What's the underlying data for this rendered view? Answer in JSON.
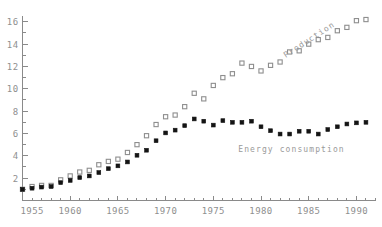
{
  "chart_data": {
    "type": "scatter",
    "title": "",
    "xlabel": "",
    "ylabel": "",
    "xlim": [
      1955,
      1992
    ],
    "ylim": [
      0,
      17
    ],
    "grid": false,
    "legend_position": "inline-annotation",
    "x_ticks": [
      1955,
      1960,
      1965,
      1970,
      1975,
      1980,
      1985,
      1990
    ],
    "x_tick_labels": [
      "1955",
      "1960",
      "1965",
      "1970",
      "1975",
      "1980",
      "1985",
      "1990"
    ],
    "x_minor_tick_step": 1,
    "y_ticks": [
      2,
      4,
      6,
      8,
      10,
      12,
      14,
      16
    ],
    "y_tick_labels": [
      "2",
      "4",
      "6",
      "8",
      "10",
      "12",
      "14",
      "16"
    ],
    "y_minor_tick_step": 1,
    "x": [
      1955,
      1956,
      1957,
      1958,
      1959,
      1960,
      1961,
      1962,
      1963,
      1964,
      1965,
      1966,
      1967,
      1968,
      1969,
      1970,
      1971,
      1972,
      1973,
      1974,
      1975,
      1976,
      1977,
      1978,
      1979,
      1980,
      1981,
      1982,
      1983,
      1984,
      1985,
      1986,
      1987,
      1988,
      1989,
      1990,
      1991
    ],
    "series": [
      {
        "name": "Production",
        "marker": "open-square",
        "color": "#8e8e8e",
        "values": [
          1.0,
          1.25,
          1.35,
          1.35,
          1.85,
          2.2,
          2.55,
          2.7,
          3.2,
          3.5,
          3.7,
          4.3,
          5.0,
          5.8,
          6.8,
          7.5,
          7.65,
          8.4,
          9.6,
          9.1,
          10.3,
          11.0,
          11.35,
          12.3,
          12.0,
          11.6,
          12.1,
          12.4,
          13.3,
          13.4,
          14.0,
          14.4,
          14.6,
          15.2,
          15.5,
          16.1,
          16.2
        ]
      },
      {
        "name": "Energy consumption",
        "marker": "filled-square",
        "color": "#141414",
        "values": [
          1.0,
          1.1,
          1.2,
          1.25,
          1.6,
          1.8,
          2.05,
          2.2,
          2.5,
          2.85,
          3.1,
          3.45,
          4.05,
          4.5,
          5.35,
          6.05,
          6.3,
          6.7,
          7.3,
          7.1,
          6.75,
          7.15,
          7.0,
          7.0,
          7.1,
          6.6,
          6.25,
          5.95,
          5.95,
          6.2,
          6.2,
          5.95,
          6.35,
          6.6,
          6.85,
          6.95,
          7.0
        ]
      }
    ],
    "annotations": [
      {
        "text": "Production",
        "x": 1985.2,
        "y": 14.2,
        "rotation": -33,
        "color": "#9a9a9a"
      },
      {
        "text": "Energy consumption",
        "x": 1983.2,
        "y": 4.35,
        "rotation": 0,
        "color": "#9a9a9a"
      }
    ]
  },
  "axes": {
    "axis_color": "#8a8a8a",
    "tick_label_color": "#8f8f8f"
  }
}
